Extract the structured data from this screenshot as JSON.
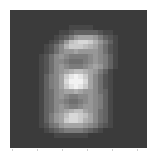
{
  "image": {
    "description": "grayscale averaged digit image (28x28 pixel grid)",
    "grid_size": [
      28,
      28
    ],
    "dark_color": "#2e2e2e",
    "bright_color": "#f2f2f2",
    "background_color": "#ffffff",
    "rows": [
      "1111111111111111111111111111",
      "1111111111111111111111111111",
      "1111111111111111111111111111",
      "1111111111112222211111111111",
      "1111111111223444443221111111",
      "1111111112346899986432111111",
      "111111112358bcddca8642111111",
      "11111112357acccba97532111111",
      "1111111235788988887532111111",
      "1111112357876666787642111111",
      "1111112357765556787642111111",
      "1111112357876667898642111111",
      "111111235789abba986421111111",
      "11111124679cefec975321111111",
      "11111124679dfffd975321111111",
      "11111124679cefec975321111111",
      "1111112457899a9887542111111",
      "1111112457876677876421111111",
      "1111112457765567876421111111",
      "1111112457876678876421111111",
      "111111245789abb9875421111111",
      "11111124689bddcb975421111111",
      "11111124689cddca975421111111",
      "1111112356899998764321111111",
      "1111111234566665432111111111",
      "1111111112222222111111111111",
      "1111111111111111111111111111",
      "1111111111111111111111111111"
    ]
  },
  "axis": {
    "tick_positions_px": [
      12,
      37,
      62,
      87,
      112,
      137
    ]
  }
}
